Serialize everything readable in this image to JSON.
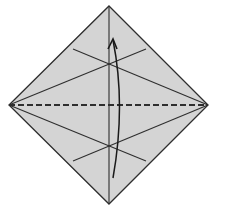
{
  "diagram": {
    "type": "origami-fold-instruction",
    "colors": {
      "paper_fill": "#d4d4d4",
      "line": "#2e2e2e",
      "background": "#ffffff"
    },
    "vertices": {
      "top": [
        109,
        6
      ],
      "right": [
        208,
        105
      ],
      "bottom": [
        109,
        204
      ],
      "left": [
        9,
        105
      ]
    },
    "crease_lines": [
      {
        "name": "vertical-diagonal",
        "from": [
          109,
          6
        ],
        "to": [
          109,
          204
        ]
      },
      {
        "name": "upper-crease-left-to-right",
        "from": [
          73,
          49
        ],
        "to": [
          208,
          105
        ]
      },
      {
        "name": "upper-crease-right-to-left",
        "from": [
          146,
          49
        ],
        "to": [
          9,
          105
        ]
      },
      {
        "name": "lower-crease-left-to-right",
        "from": [
          9,
          105
        ],
        "to": [
          146,
          161
        ]
      },
      {
        "name": "lower-crease-right-to-left",
        "from": [
          208,
          105
        ],
        "to": [
          73,
          161
        ]
      }
    ],
    "fold_line": {
      "name": "horizontal-valley-fold",
      "style": "dashed",
      "from": [
        9,
        105
      ],
      "to": [
        208,
        105
      ]
    },
    "arrow": {
      "name": "fold-up-arrow",
      "from": [
        113,
        178
      ],
      "control": [
        126,
        105
      ],
      "to": [
        113,
        40
      ]
    }
  }
}
